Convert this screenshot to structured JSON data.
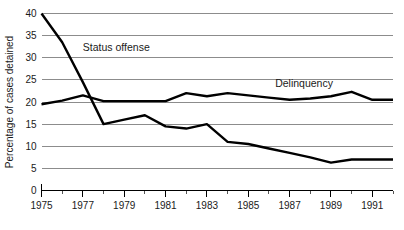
{
  "chart_data": {
    "type": "line",
    "title": "",
    "xlabel": "",
    "ylabel": "Percentage of cases detained",
    "ylim": [
      0,
      40
    ],
    "xlim": [
      1975,
      1992
    ],
    "grid": true,
    "legend_position": "inline-annotations",
    "yticks": [
      0,
      5,
      10,
      15,
      20,
      25,
      30,
      35,
      40
    ],
    "ytick_labels": [
      "0",
      "5",
      "10",
      "15",
      "20",
      "25",
      "30",
      "35",
      "40"
    ],
    "xticks_major": [
      1975,
      1977,
      1979,
      1981,
      1983,
      1985,
      1987,
      1989,
      1991
    ],
    "xtick_labels": [
      "1975",
      "1977",
      "1979",
      "1981",
      "1983",
      "1985",
      "1987",
      "1989",
      "1991"
    ],
    "xticks_minor": [
      1976,
      1978,
      1980,
      1982,
      1984,
      1986,
      1988,
      1990,
      1992
    ],
    "x": [
      1975,
      1976,
      1977,
      1978,
      1979,
      1980,
      1981,
      1982,
      1983,
      1984,
      1985,
      1986,
      1987,
      1988,
      1989,
      1990,
      1991,
      1992
    ],
    "series": [
      {
        "name": "Status offense",
        "label": "Status offense",
        "label_x": 1977.0,
        "label_y": 31.5,
        "color": "#000000",
        "values": [
          40.0,
          33.5,
          24.5,
          15.0,
          16.0,
          17.0,
          14.5,
          14.0,
          15.0,
          11.0,
          10.5,
          9.5,
          8.5,
          7.5,
          6.3,
          7.0,
          7.0,
          7.0
        ]
      },
      {
        "name": "Delinquency",
        "label": "Delinquency",
        "label_x": 1986.3,
        "label_y": 23.3,
        "color": "#000000",
        "values": [
          19.5,
          20.3,
          21.5,
          20.2,
          20.2,
          20.2,
          20.2,
          22.0,
          21.3,
          22.0,
          21.5,
          21.0,
          20.5,
          20.8,
          21.3,
          22.3,
          20.5,
          20.5
        ]
      }
    ]
  }
}
